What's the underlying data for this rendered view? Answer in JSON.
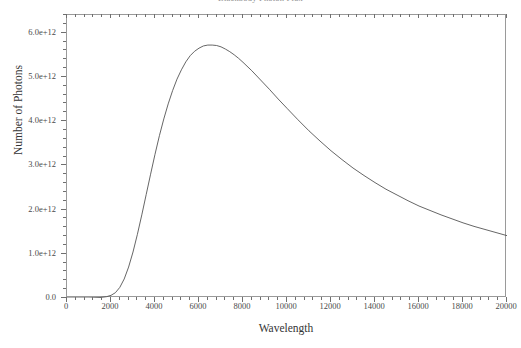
{
  "chart_data": {
    "type": "line",
    "title": "Blackbody Photon Flux",
    "xlabel": "Wavelength",
    "ylabel": "Number of Photons",
    "xlim": [
      0,
      20000
    ],
    "ylim": [
      0,
      6400000000000
    ],
    "grid": false,
    "legend": "none",
    "xticks": [
      "0",
      "2000",
      "4000",
      "6000",
      "8000",
      "10000",
      "12000",
      "14000",
      "16000",
      "18000",
      "20000"
    ],
    "xtick_values": [
      0,
      2000,
      4000,
      6000,
      8000,
      10000,
      12000,
      14000,
      16000,
      18000,
      20000
    ],
    "yticks": [
      "0.0",
      "1.0e+12",
      "2.0e+12",
      "3.0e+12",
      "4.0e+12",
      "5.0e+12",
      "6.0e+12"
    ],
    "ytick_values": [
      0,
      1000000000000,
      2000000000000,
      3000000000000,
      4000000000000,
      5000000000000,
      6000000000000
    ],
    "series": [
      {
        "name": "photon-distribution",
        "color": "#555555",
        "x": [
          0,
          500,
          1000,
          1500,
          1800,
          2000,
          2200,
          2400,
          2600,
          2800,
          3000,
          3200,
          3400,
          3600,
          3800,
          4000,
          4200,
          4400,
          4600,
          4800,
          5000,
          5200,
          5400,
          5600,
          5800,
          6000,
          6200,
          6400,
          6600,
          6800,
          7000,
          7200,
          7400,
          7600,
          7800,
          8000,
          8400,
          8800,
          9200,
          9600,
          10000,
          10500,
          11000,
          11500,
          12000,
          12500,
          13000,
          13500,
          14000,
          14500,
          15000,
          15500,
          16000,
          16500,
          17000,
          17500,
          18000,
          18500,
          19000,
          19500,
          20000
        ],
        "y": [
          0,
          0,
          0,
          10000000000,
          30000000000,
          60000000000,
          120000000000,
          240000000000,
          430000000000,
          700000000000,
          1040000000000,
          1440000000000,
          1880000000000,
          2340000000000,
          2800000000000,
          3250000000000,
          3670000000000,
          4050000000000,
          4390000000000,
          4690000000000,
          4950000000000,
          5160000000000,
          5340000000000,
          5480000000000,
          5580000000000,
          5650000000000,
          5700000000000,
          5720000000000,
          5720000000000,
          5710000000000,
          5680000000000,
          5630000000000,
          5570000000000,
          5500000000000,
          5420000000000,
          5330000000000,
          5140000000000,
          4930000000000,
          4720000000000,
          4500000000000,
          4290000000000,
          4030000000000,
          3780000000000,
          3550000000000,
          3330000000000,
          3130000000000,
          2940000000000,
          2770000000000,
          2610000000000,
          2460000000000,
          2330000000000,
          2200000000000,
          2080000000000,
          1980000000000,
          1880000000000,
          1790000000000,
          1700000000000,
          1620000000000,
          1550000000000,
          1480000000000,
          1410000000000
        ]
      }
    ]
  },
  "axes": {
    "x_title": "Wavelength",
    "y_title": "Number of Photons"
  },
  "title": {
    "text": "Blackbody Photon Flux"
  }
}
